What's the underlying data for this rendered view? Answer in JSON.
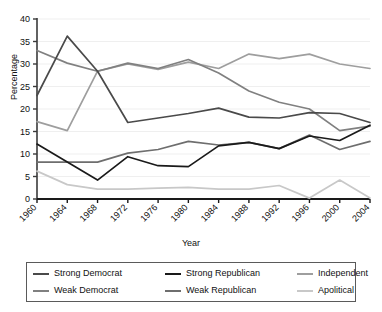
{
  "chart_data": {
    "type": "line",
    "title": "",
    "xlabel": "Year",
    "ylabel": "Percentage",
    "x": [
      1960,
      1964,
      1968,
      1972,
      1976,
      1980,
      1984,
      1988,
      1992,
      1996,
      2000,
      2004
    ],
    "xtick_labels": [
      "1960",
      "1964",
      "1968",
      "1972",
      "1976",
      "1980",
      "1984",
      "1988",
      "1992",
      "1996",
      "2000",
      "2004"
    ],
    "ytick_labels": [
      "0",
      "5",
      "10",
      "15",
      "20",
      "25",
      "30",
      "35",
      "40"
    ],
    "yticks": [
      0,
      5,
      10,
      15,
      20,
      25,
      30,
      35,
      40
    ],
    "ylim": [
      0,
      40
    ],
    "grid": true,
    "legend_position": "below",
    "series": [
      {
        "name": "Strong Democrat",
        "color": "#4a4a4a",
        "values": [
          23.0,
          36.2,
          28.4,
          17.0,
          18.0,
          19.0,
          20.2,
          18.2,
          18.0,
          19.2,
          19.0,
          17.0
        ]
      },
      {
        "name": "Weak Democrat",
        "color": "#808080",
        "values": [
          33.0,
          30.2,
          28.4,
          30.2,
          29.0,
          31.0,
          28.0,
          24.0,
          21.5,
          20.0,
          15.2,
          16.2
        ]
      },
      {
        "name": "Strong Republican",
        "color": "#1a1a1a",
        "values": [
          12.2,
          8.2,
          4.2,
          9.4,
          7.4,
          7.2,
          11.8,
          12.6,
          11.2,
          14.0,
          13.0,
          16.4
        ]
      },
      {
        "name": "Weak Republican",
        "color": "#6e6e6e",
        "values": [
          8.2,
          8.2,
          8.2,
          10.2,
          11.0,
          12.8,
          12.0,
          12.6,
          11.2,
          14.2,
          11.0,
          12.8
        ]
      },
      {
        "name": "Independent",
        "color": "#9e9e9e",
        "values": [
          17.2,
          15.2,
          28.4,
          30.0,
          28.8,
          30.4,
          29.0,
          32.2,
          31.2,
          32.2,
          30.0,
          29.0
        ]
      },
      {
        "name": "Apolitical",
        "color": "#c8c8c8",
        "values": [
          6.2,
          3.2,
          2.2,
          2.2,
          2.4,
          2.6,
          2.2,
          2.2,
          3.0,
          0.2,
          4.2,
          0.2
        ]
      }
    ]
  },
  "legend": {
    "items": [
      {
        "label": "Strong Democrat",
        "color": "#4a4a4a"
      },
      {
        "label": "Strong Republican",
        "color": "#1a1a1a"
      },
      {
        "label": "Independent",
        "color": "#9e9e9e"
      },
      {
        "label": "Weak Democrat",
        "color": "#808080"
      },
      {
        "label": "Weak Republican",
        "color": "#6e6e6e"
      },
      {
        "label": "Apolitical",
        "color": "#c8c8c8"
      }
    ]
  }
}
